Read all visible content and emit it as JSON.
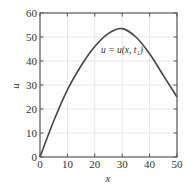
{
  "chart_data": {
    "type": "line",
    "title": "",
    "xlabel": "x",
    "ylabel": "u",
    "xlim": [
      0,
      50
    ],
    "ylim": [
      0,
      60
    ],
    "x_ticks": [
      0,
      10,
      20,
      30,
      40,
      50
    ],
    "y_ticks": [
      0,
      10,
      20,
      30,
      40,
      50,
      60
    ],
    "grid": true,
    "legend": null,
    "annotations": [
      {
        "text": "u = u(x, t₁)",
        "x": 25,
        "y": 45
      }
    ],
    "series": [
      {
        "name": "u = u(x, t₁)",
        "x": [
          0,
          5,
          10,
          15,
          20,
          25,
          30,
          35,
          40,
          45,
          50
        ],
        "values": [
          0,
          15,
          28,
          38,
          46,
          51.5,
          53.5,
          50,
          43,
          34,
          25
        ]
      }
    ]
  },
  "colors": {
    "axis": "#555555",
    "grid": "#e6e6e6",
    "curve": "#444444",
    "text": "#333333"
  },
  "labels": {
    "xlabel": "x",
    "ylabel": "u",
    "annotation": "u = u(x, t₁)"
  }
}
